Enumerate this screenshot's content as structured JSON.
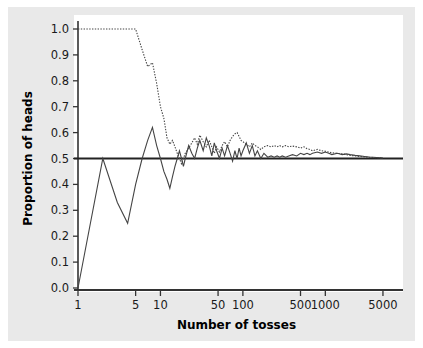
{
  "figure": {
    "background_color": "#e9e9e9",
    "plot_background_color": "#ffffff",
    "axis_color": "#333333",
    "series_color": "#444444",
    "reference_line_color": "#222222"
  },
  "chart_data": {
    "type": "line",
    "title": "",
    "xlabel": "Number of tosses",
    "ylabel": "Proportion of heads",
    "xscale": "log",
    "xlim": [
      1,
      7000
    ],
    "ylim": [
      0.0,
      1.0
    ],
    "grid": false,
    "legend": null,
    "xticks": [
      1,
      5,
      10,
      50,
      100,
      500,
      1000,
      5000
    ],
    "xticklabels": [
      "1",
      "5",
      "10",
      "50",
      "100",
      "500",
      "1000",
      "5000"
    ],
    "yticks": [
      0.0,
      0.1,
      0.2,
      0.3,
      0.4,
      0.5,
      0.6,
      0.7,
      0.8,
      0.9,
      1.0
    ],
    "yticklabels": [
      "0.0",
      "0.1",
      "0.2",
      "0.3",
      "0.4",
      "0.5",
      "0.6",
      "0.7",
      "0.8",
      "0.9",
      "1.0"
    ],
    "reference_line": {
      "y": 0.5,
      "style": "solid",
      "label": "0.5"
    },
    "series": [
      {
        "name": "trial-1",
        "style": "solid",
        "x": [
          1,
          2,
          3,
          4,
          5,
          6,
          7,
          8,
          9,
          10,
          11,
          12,
          13,
          14,
          15,
          16,
          17,
          18,
          19,
          20,
          22,
          24,
          26,
          28,
          30,
          33,
          36,
          39,
          42,
          45,
          48,
          52,
          56,
          60,
          65,
          70,
          75,
          80,
          85,
          90,
          95,
          100,
          110,
          120,
          130,
          140,
          150,
          165,
          180,
          200,
          220,
          240,
          260,
          280,
          300,
          330,
          360,
          400,
          450,
          500,
          550,
          600,
          650,
          700,
          800,
          900,
          1000,
          1100,
          1200,
          1400,
          1600,
          1800,
          2000,
          2300,
          2600,
          3000,
          3400,
          3800,
          4200,
          4600,
          5000
        ],
        "values": [
          0.0,
          0.5,
          0.33,
          0.25,
          0.4,
          0.5,
          0.57,
          0.62,
          0.55,
          0.5,
          0.45,
          0.42,
          0.385,
          0.43,
          0.47,
          0.5,
          0.53,
          0.5,
          0.47,
          0.5,
          0.55,
          0.52,
          0.5,
          0.54,
          0.57,
          0.53,
          0.58,
          0.55,
          0.51,
          0.56,
          0.53,
          0.5,
          0.54,
          0.51,
          0.55,
          0.52,
          0.49,
          0.53,
          0.5,
          0.54,
          0.51,
          0.53,
          0.56,
          0.52,
          0.55,
          0.51,
          0.53,
          0.5,
          0.52,
          0.505,
          0.51,
          0.505,
          0.51,
          0.505,
          0.51,
          0.505,
          0.51,
          0.515,
          0.51,
          0.52,
          0.515,
          0.52,
          0.515,
          0.52,
          0.525,
          0.52,
          0.525,
          0.52,
          0.515,
          0.52,
          0.515,
          0.518,
          0.515,
          0.512,
          0.51,
          0.508,
          0.506,
          0.505,
          0.504,
          0.503,
          0.502
        ]
      },
      {
        "name": "trial-2",
        "style": "dotted",
        "x": [
          1,
          2,
          3,
          4,
          5,
          6,
          7,
          8,
          9,
          10,
          11,
          12,
          13,
          14,
          15,
          16,
          17,
          18,
          19,
          20,
          22,
          24,
          26,
          28,
          30,
          33,
          36,
          39,
          42,
          45,
          48,
          52,
          56,
          60,
          65,
          70,
          75,
          80,
          85,
          90,
          95,
          100,
          110,
          120,
          130,
          140,
          150,
          165,
          180,
          200,
          220,
          240,
          260,
          280,
          300,
          330,
          360,
          400,
          450,
          500,
          550,
          600,
          650,
          700,
          800,
          900,
          1000,
          1100,
          1200,
          1400,
          1600,
          1800,
          2000,
          2300,
          2600,
          3000,
          3400,
          3800,
          4200,
          4600,
          5000
        ],
        "values": [
          1.0,
          1.0,
          1.0,
          1.0,
          1.0,
          0.92,
          0.855,
          0.87,
          0.79,
          0.7,
          0.655,
          0.58,
          0.555,
          0.57,
          0.545,
          0.52,
          0.5,
          0.48,
          0.5,
          0.52,
          0.54,
          0.56,
          0.58,
          0.555,
          0.59,
          0.565,
          0.545,
          0.57,
          0.545,
          0.52,
          0.545,
          0.525,
          0.55,
          0.565,
          0.545,
          0.57,
          0.585,
          0.595,
          0.6,
          0.585,
          0.57,
          0.565,
          0.555,
          0.545,
          0.56,
          0.55,
          0.545,
          0.535,
          0.545,
          0.55,
          0.545,
          0.55,
          0.545,
          0.55,
          0.545,
          0.55,
          0.545,
          0.548,
          0.545,
          0.54,
          0.545,
          0.538,
          0.535,
          0.53,
          0.535,
          0.53,
          0.528,
          0.525,
          0.522,
          0.52,
          0.518,
          0.515,
          0.512,
          0.51,
          0.508,
          0.506,
          0.505,
          0.504,
          0.503,
          0.503,
          0.502
        ]
      }
    ]
  }
}
